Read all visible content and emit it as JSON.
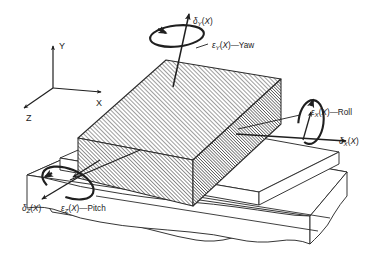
{
  "figure": {
    "background_color": "#ffffff",
    "line_color": "#2b2b2b",
    "hatch_color": "#3a3a3a"
  },
  "axes": {
    "name": "coordinate-triad",
    "x_label": "X",
    "y_label": "Y",
    "z_label": "Z"
  },
  "labels": {
    "delta_y": {
      "symbol": "δ",
      "subscript": "Y",
      "arg": "(X)",
      "text": "δY(X)"
    },
    "epsilon_y": {
      "symbol": "ε",
      "subscript": "Y",
      "arg": "(X)",
      "dash": "—",
      "name": "Yaw",
      "text": "εY(X)—Yaw"
    },
    "delta_x": {
      "symbol": "δ",
      "subscript": "X",
      "arg": "(X)",
      "text": "δX(X)"
    },
    "epsilon_x": {
      "symbol": "ε",
      "subscript": "X",
      "arg": "(X)",
      "dash": "—",
      "name": "Roll",
      "text": "εX(X)—Roll"
    },
    "delta_z": {
      "symbol": "δ",
      "subscript": "Z",
      "arg": "(X)",
      "text": "δZ(X)"
    },
    "epsilon_z": {
      "symbol": "ε",
      "subscript": "Z",
      "arg": "(X)",
      "dash": "—",
      "name": "Pitch",
      "text": "εZ(X)—Pitch"
    }
  },
  "parts": {
    "slider_block": "hatched-rectangular-slider-block",
    "base_slab": "machine-base-slab",
    "guide_rail": "guideway-rail",
    "break_edge": "wavy-break-line"
  },
  "rotations": [
    {
      "name": "yaw",
      "axis": "Y",
      "label": "εY(X)—Yaw"
    },
    {
      "name": "roll",
      "axis": "X",
      "label": "εX(X)—Roll"
    },
    {
      "name": "pitch",
      "axis": "Z",
      "label": "εZ(X)—Pitch"
    }
  ],
  "translations": [
    {
      "name": "vertical-straightness",
      "axis": "Y",
      "label": "δY(X)"
    },
    {
      "name": "positioning",
      "axis": "X",
      "label": "δX(X)"
    },
    {
      "name": "horizontal-straightness",
      "axis": "Z",
      "label": "δZ(X)"
    }
  ]
}
